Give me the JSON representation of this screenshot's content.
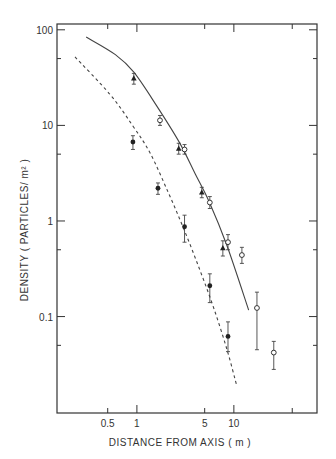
{
  "chart_data": {
    "type": "scatter",
    "title": "",
    "xlabel": "DISTANCE FROM AXIS ( m )",
    "ylabel": "DENSITY ( PARTICLES/ m² )",
    "xscale": "log",
    "yscale": "log",
    "xlim": [
      0.15,
      72
    ],
    "ylim": [
      0.0098,
      115
    ],
    "x_ticks": [
      {
        "value": 0.5,
        "label": "0.5"
      },
      {
        "value": 1,
        "label": "1"
      },
      {
        "value": 5,
        "label": "5"
      },
      {
        "value": 10,
        "label": "10"
      },
      {
        "value": 40,
        "label": ""
      }
    ],
    "y_ticks": [
      {
        "value": 100,
        "label": "100"
      },
      {
        "value": 10,
        "label": "10"
      },
      {
        "value": 1,
        "label": "1"
      },
      {
        "value": 0.1,
        "label": "0.1"
      }
    ],
    "y_minor_ticks": [
      50,
      5,
      0.5,
      0.05
    ],
    "grid": false,
    "series": [
      {
        "name": "filled-triangles",
        "marker": "triangle-filled",
        "points": [
          {
            "x": 0.93,
            "y": 31,
            "err": [
              27,
              35
            ]
          },
          {
            "x": 2.7,
            "y": 5.7,
            "err": [
              5.0,
              6.5
            ]
          },
          {
            "x": 4.67,
            "y": 1.98,
            "err": [
              1.75,
              2.25
            ]
          },
          {
            "x": 7.7,
            "y": 0.52,
            "err": [
              0.43,
              0.62
            ]
          }
        ]
      },
      {
        "name": "open-circles",
        "marker": "circle-open",
        "points": [
          {
            "x": 1.73,
            "y": 11.3,
            "err": [
              10.0,
              12.7
            ]
          },
          {
            "x": 3.1,
            "y": 5.6,
            "err": [
              5.0,
              6.3
            ]
          },
          {
            "x": 5.65,
            "y": 1.56,
            "err": [
              1.35,
              1.8
            ]
          },
          {
            "x": 8.7,
            "y": 0.6,
            "err": [
              0.5,
              0.72
            ]
          },
          {
            "x": 12.1,
            "y": 0.44,
            "err": [
              0.36,
              0.53
            ]
          },
          {
            "x": 17.3,
            "y": 0.123,
            "err": [
              0.045,
              0.18
            ]
          },
          {
            "x": 25.8,
            "y": 0.042,
            "err": [
              0.028,
              0.055
            ]
          }
        ]
      },
      {
        "name": "filled-circles",
        "marker": "circle-filled",
        "points": [
          {
            "x": 0.91,
            "y": 6.7,
            "err": [
              5.6,
              7.8
            ]
          },
          {
            "x": 1.65,
            "y": 2.2,
            "err": [
              1.9,
              2.5
            ]
          },
          {
            "x": 3.1,
            "y": 0.87,
            "err": [
              0.6,
              1.15
            ]
          },
          {
            "x": 5.65,
            "y": 0.21,
            "err": [
              0.14,
              0.28
            ]
          },
          {
            "x": 8.7,
            "y": 0.062,
            "err": [
              0.043,
              0.088
            ]
          }
        ]
      }
    ],
    "curves": [
      {
        "name": "solid-curve",
        "style": "solid",
        "points": [
          [
            0.3,
            84
          ],
          [
            0.6,
            55
          ],
          [
            0.93,
            36
          ],
          [
            1.6,
            16
          ],
          [
            2.75,
            6.6
          ],
          [
            4.0,
            3.1
          ],
          [
            5.55,
            1.6
          ],
          [
            8.5,
            0.55
          ],
          [
            14.2,
            0.117
          ]
        ]
      },
      {
        "name": "dashed-curve",
        "style": "dashed",
        "points": [
          [
            0.23,
            52
          ],
          [
            0.53,
            21
          ],
          [
            0.9,
            10
          ],
          [
            1.36,
            5.2
          ],
          [
            2.1,
            2.0
          ],
          [
            3.1,
            0.79
          ],
          [
            4.5,
            0.3
          ],
          [
            6.25,
            0.12
          ],
          [
            8.5,
            0.045
          ],
          [
            10.7,
            0.019
          ]
        ]
      }
    ],
    "legend": "none"
  }
}
